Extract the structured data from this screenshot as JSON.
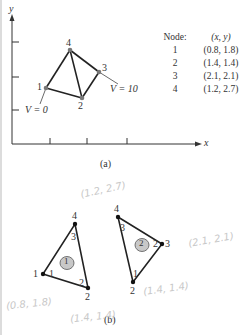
{
  "figure": {
    "part_a": {
      "caption": "(a)",
      "axes": {
        "x_label": "x",
        "y_label": "y"
      },
      "nodes": [
        {
          "id": "1",
          "label": "1"
        },
        {
          "id": "2",
          "label": "2"
        },
        {
          "id": "3",
          "label": "3"
        },
        {
          "id": "4",
          "label": "4"
        }
      ],
      "boundary_labels": {
        "v0": "V = 0",
        "v10": "V = 10"
      },
      "table": {
        "header": [
          "Node:",
          "(x, y)"
        ],
        "rows": [
          [
            "1",
            "(0.8, 1.8)"
          ],
          [
            "2",
            "(1.4, 1.4)"
          ],
          [
            "3",
            "(2.1, 2.1)"
          ],
          [
            "4",
            "(1.2, 2.7)"
          ]
        ]
      }
    },
    "part_b": {
      "caption": "(b)",
      "element1": {
        "element_label": "1",
        "global_nodes": {
          "a": "1",
          "b": "2",
          "c": "4"
        },
        "local_nodes": {
          "a": "1",
          "b": "2",
          "c": "3"
        }
      },
      "element2": {
        "element_label": "2",
        "global_nodes": {
          "a": "2",
          "b": "3",
          "c": "4"
        },
        "local_nodes": {
          "a": "1",
          "b": "2",
          "c": "3"
        }
      },
      "handwritten_notes": {
        "top": "(1.2, 2.7)",
        "right": "(2.1, 2.1)",
        "bottom_right": "(1.4, 1.4)",
        "bottom_left": "(0.8, 1.8)",
        "bottom_mid": "(1.4, 1.4)"
      }
    },
    "colors": {
      "line": "#222222",
      "node_a": "#777777",
      "element_fill": "#c8c8c8",
      "pencil": "#c8c8c8"
    }
  }
}
